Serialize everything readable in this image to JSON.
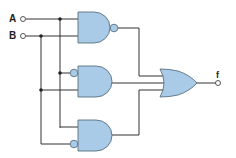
{
  "diagram": {
    "type": "logic-circuit",
    "inputs": [
      {
        "id": "A",
        "label": "A"
      },
      {
        "id": "B",
        "label": "B"
      }
    ],
    "output": {
      "id": "f",
      "label": "f"
    },
    "gates": [
      {
        "id": "g1",
        "type": "NAND",
        "inputs": [
          "A",
          "B"
        ],
        "inverted_inputs": [],
        "inverted_output": true
      },
      {
        "id": "g2",
        "type": "AND",
        "inputs": [
          "A",
          "B"
        ],
        "inverted_inputs": [
          "A"
        ],
        "inverted_output": false
      },
      {
        "id": "g3",
        "type": "AND",
        "inputs": [
          "A",
          "B"
        ],
        "inverted_inputs": [
          "B"
        ],
        "inverted_output": false
      },
      {
        "id": "g4",
        "type": "OR",
        "inputs": [
          "g1",
          "g2",
          "g3"
        ],
        "inverted_output": false
      }
    ],
    "colors": {
      "gate_fill": "#a9cbe8",
      "gate_stroke": "#5a6f80",
      "wire": "#333333",
      "background": "#ffffff"
    }
  }
}
